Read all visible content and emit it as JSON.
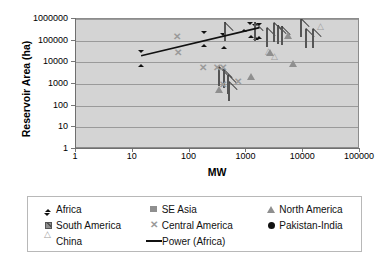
{
  "chart_data": {
    "type": "scatter",
    "title": "",
    "xlabel": "MW",
    "ylabel": "Reservoir Area (ha)",
    "xscale": "log",
    "yscale": "log",
    "xlim": [
      1,
      100000
    ],
    "ylim": [
      1,
      1000000
    ],
    "xticks": [
      1,
      10,
      100,
      1000,
      10000,
      100000
    ],
    "xtick_labels": [
      "1",
      "10",
      "100",
      "1000",
      "10000",
      "100000"
    ],
    "yticks": [
      1,
      10,
      100,
      1000,
      10000,
      100000,
      1000000
    ],
    "ytick_labels": [
      "1",
      "10",
      "100",
      "1000",
      "10000",
      "100000",
      "1000000"
    ],
    "grid": "horizontal",
    "plot_background": "#d4d4d4",
    "legend_position": "bottom",
    "series": [
      {
        "name": "Africa",
        "marker": "diamond",
        "color": "#111111",
        "points": [
          [
            14,
            20000
          ],
          [
            180,
            160000
          ],
          [
            400,
            130000
          ],
          [
            900,
            800000
          ],
          [
            1200,
            430000
          ],
          [
            1700,
            380000
          ],
          [
            1450,
            330000
          ]
        ]
      },
      {
        "name": "South America",
        "marker": "square-pattern",
        "color": "#8f8f8f",
        "points": [
          [
            420,
            250000
          ],
          [
            1400,
            250000
          ],
          [
            2300,
            140000
          ],
          [
            3000,
            230000
          ],
          [
            3600,
            175000
          ],
          [
            4200,
            160000
          ],
          [
            9000,
            380000
          ],
          [
            11000,
            120000
          ],
          [
            15000,
            120000
          ],
          [
            330,
            2200
          ],
          [
            400,
            1700
          ],
          [
            500,
            450
          ],
          [
            480,
            900
          ]
        ]
      },
      {
        "name": "China",
        "marker": "triangle-open",
        "color": "#9d9d9d",
        "points": [
          [
            2600,
            8000
          ],
          [
            3300,
            5000
          ],
          [
            21000,
            120000
          ]
        ]
      },
      {
        "name": "SE Asia",
        "marker": "square",
        "color": "#8f8f8f",
        "points": [
          [
            30,
            6000
          ],
          [
            35,
            5500
          ],
          [
            400,
            40000
          ],
          [
            330,
            2100
          ],
          [
            1800,
            90000
          ],
          [
            2000,
            88000
          ]
        ]
      },
      {
        "name": "Central America",
        "marker": "x",
        "color": "#9a9a9a",
        "points": [
          [
            60,
            180000
          ],
          [
            62,
            33000
          ],
          [
            170,
            7000
          ],
          [
            300,
            7000
          ],
          [
            380,
            7000
          ],
          [
            390,
            1100
          ],
          [
            700,
            1500
          ]
        ]
      },
      {
        "name": "North America",
        "marker": "triangle-filled",
        "color": "#8f8f8f",
        "points": [
          [
            330,
            1900
          ],
          [
            1200,
            7500
          ],
          [
            2600,
            95000
          ],
          [
            5500,
            600000
          ],
          [
            6500,
            30000
          ]
        ]
      },
      {
        "name": "Pakistan-India",
        "marker": "circle",
        "color": "#111111",
        "points": [
          [
            900,
            130000
          ],
          [
            1100,
            95000
          ],
          [
            1000,
            22000
          ],
          [
            900,
            3000
          ],
          [
            1500,
            4500
          ],
          [
            2600,
            25000
          ],
          [
            400,
            45
          ]
        ]
      }
    ],
    "trend": {
      "name": "Power (Africa)",
      "style": "solid-line",
      "color": "#111111",
      "from": [
        14,
        20000
      ],
      "to": [
        1700,
        400000
      ]
    }
  },
  "legend": {
    "entries": [
      {
        "label": "Africa",
        "marker": "diamond"
      },
      {
        "label": "SE Asia",
        "marker": "square"
      },
      {
        "label": "North America",
        "marker": "triangle-filled"
      },
      {
        "label": "South America",
        "marker": "square-pattern"
      },
      {
        "label": "Central America",
        "marker": "x"
      },
      {
        "label": "Pakistan-India",
        "marker": "circle"
      },
      {
        "label": "China",
        "marker": "triangle-open"
      },
      {
        "label": "Power (Africa)",
        "marker": "line"
      }
    ]
  }
}
